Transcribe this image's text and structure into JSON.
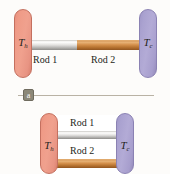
{
  "figure": {
    "panels": [
      {
        "id": "a",
        "caption": "a",
        "arrangement": "series",
        "hot_reservoir_label": "T",
        "hot_reservoir_subscript": "h",
        "cold_reservoir_label": "T",
        "cold_reservoir_subscript": "c",
        "rods": [
          {
            "name": "Rod 1",
            "material_color": "#c9c8c5",
            "material": "silver"
          },
          {
            "name": "Rod 2",
            "material_color": "#c4863f",
            "material": "copper"
          }
        ]
      },
      {
        "id": "b",
        "caption": "b",
        "arrangement": "parallel",
        "hot_reservoir_label": "T",
        "hot_reservoir_subscript": "h",
        "cold_reservoir_label": "T",
        "cold_reservoir_subscript": "c",
        "rods": [
          {
            "name": "Rod 1",
            "material_color": "#c9c8c5",
            "material": "silver"
          },
          {
            "name": "Rod 2",
            "material_color": "#c4863f",
            "material": "copper"
          }
        ]
      }
    ],
    "colors": {
      "hot": "#ef9b87",
      "cold": "#aaa2d0",
      "silver_rod": "#d0cfcc",
      "copper_rod": "#c4863f",
      "background": "#fdfcfa",
      "caption_box": "#8c8878",
      "caption_rule": "#b9b2a4",
      "text": "#231f20"
    }
  }
}
